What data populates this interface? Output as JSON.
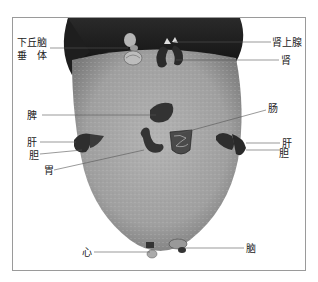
{
  "diagram": {
    "colors": {
      "frame": "#9a9a9a",
      "leader_line": "#555555",
      "tongue_surface": "#a8a8a8",
      "tongue_root_shadow": "#1a1a1a",
      "organ": "#3a3a3a",
      "label_text": "#222222"
    },
    "labels": {
      "hypothalamus": "下丘脑",
      "pituitary": "垂　体",
      "adrenal": "肾上腺",
      "kidney": "肾",
      "spleen": "脾",
      "intestine": "肠",
      "liver_left": "肝",
      "gallbladder_left": "胆",
      "stomach": "胃",
      "liver_right": "肝",
      "gallbladder_right": "胆",
      "heart": "心",
      "brain": "脑"
    }
  }
}
